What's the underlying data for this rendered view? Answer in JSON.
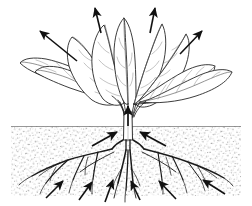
{
  "figure": {
    "style": "black and white pen-and-ink botanical line drawing",
    "background_color": "#ffffff",
    "ink_color": "#1a1a1a",
    "vein_color": "#5a5a5a",
    "soil_dot_color": "#9a9a9a",
    "width": 252,
    "height": 206
  },
  "scene": {
    "plant": {
      "name": "leafy-rosette-plant",
      "common_type": "beet / spinach type rosette",
      "leaf_count": 9,
      "stem": {
        "name": "central-stem",
        "x": 128,
        "top_y": 104,
        "bottom_y": 140,
        "width": 7
      },
      "soil_line": {
        "name": "soil-surface-line",
        "y": 126,
        "x_start": 11,
        "x_end": 241
      }
    },
    "soil": {
      "name": "soil-region",
      "x": 11,
      "y": 126,
      "width": 230,
      "height": 70,
      "texture": "stipple-dots",
      "fill": "#ffffff"
    },
    "roots": {
      "name": "fibrous-root-system",
      "origin_x": 128,
      "origin_y": 140,
      "spread_left_x": 20,
      "spread_right_x": 232,
      "max_depth_y": 196
    }
  },
  "arrows": {
    "transpiration_label": "water vapour leaving leaves",
    "uptake_label": "water and nutrients entering roots",
    "transpiration": [
      {
        "name": "transpiration-arrow-upper-left",
        "x1": 77,
        "y1": 61,
        "x2": 40,
        "y2": 31
      },
      {
        "name": "transpiration-arrow-top-left",
        "x1": 101,
        "y1": 33,
        "x2": 95,
        "y2": 8
      },
      {
        "name": "transpiration-arrow-top-right",
        "x1": 150,
        "y1": 33,
        "x2": 155,
        "y2": 8
      },
      {
        "name": "transpiration-arrow-upper-right",
        "x1": 180,
        "y1": 54,
        "x2": 202,
        "y2": 31
      }
    ],
    "stem_uptake": [
      {
        "name": "stem-uptake-arrow-center",
        "x1": 128,
        "y1": 126,
        "x2": 128,
        "y2": 106
      },
      {
        "name": "stem-uptake-arrow-left",
        "x1": 92,
        "y1": 146,
        "x2": 117,
        "y2": 132
      },
      {
        "name": "stem-uptake-arrow-right",
        "x1": 166,
        "y1": 146,
        "x2": 140,
        "y2": 132
      }
    ],
    "root_uptake": [
      {
        "name": "root-uptake-arrow-1",
        "x1": 46,
        "y1": 198,
        "x2": 63,
        "y2": 181
      },
      {
        "name": "root-uptake-arrow-2",
        "x1": 79,
        "y1": 200,
        "x2": 92,
        "y2": 182
      },
      {
        "name": "root-uptake-arrow-3",
        "x1": 105,
        "y1": 202,
        "x2": 113,
        "y2": 180
      },
      {
        "name": "root-uptake-arrow-4",
        "x1": 140,
        "y1": 200,
        "x2": 131,
        "y2": 181
      },
      {
        "name": "root-uptake-arrow-5",
        "x1": 176,
        "y1": 199,
        "x2": 159,
        "y2": 181
      },
      {
        "name": "root-uptake-arrow-6",
        "x1": 225,
        "y1": 194,
        "x2": 203,
        "y2": 180
      }
    ]
  },
  "leaves": [
    {
      "name": "leaf-far-left",
      "tip_x": 20,
      "tip_y": 63
    },
    {
      "name": "leaf-left-lower",
      "tip_x": 35,
      "tip_y": 72
    },
    {
      "name": "leaf-left-upper",
      "tip_x": 72,
      "tip_y": 37
    },
    {
      "name": "leaf-center-left",
      "tip_x": 104,
      "tip_y": 25
    },
    {
      "name": "leaf-center",
      "tip_x": 124,
      "tip_y": 18
    },
    {
      "name": "leaf-center-right",
      "tip_x": 148,
      "tip_y": 23
    },
    {
      "name": "leaf-right-upper",
      "tip_x": 176,
      "tip_y": 32
    },
    {
      "name": "leaf-right-lower",
      "tip_x": 215,
      "tip_y": 66
    },
    {
      "name": "leaf-far-right",
      "tip_x": 232,
      "tip_y": 72
    }
  ]
}
